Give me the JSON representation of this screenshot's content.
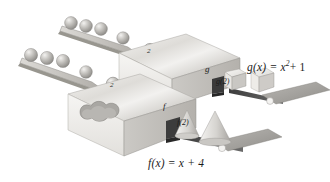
{
  "figure": {
    "background_color": "#ffffff",
    "ink_color": "#1b1b1b",
    "box_face_light": "#efeeec",
    "box_face_mid": "#d9d7d3",
    "box_face_dark": "#b8b5b0",
    "belt_color": "#4a4a4a",
    "platform_color": "#a8a6a2",
    "sphere_color": "#b9b7b3"
  },
  "machines": [
    {
      "id": "g-machine",
      "face_label": "g",
      "input_label": "2",
      "output_label": "g(2)",
      "equation_plain": "g(x) = x",
      "equation_exponent": "2",
      "equation_tail": "+ 1",
      "output_shape": "cube",
      "output_count": 2,
      "input_spheres": 5
    },
    {
      "id": "f-machine",
      "face_label": "f",
      "input_label": "2",
      "output_label": "f(2)",
      "equation_plain": "f(x) = x + 4",
      "output_shape": "cone",
      "output_count": 2,
      "input_spheres": 5
    }
  ]
}
